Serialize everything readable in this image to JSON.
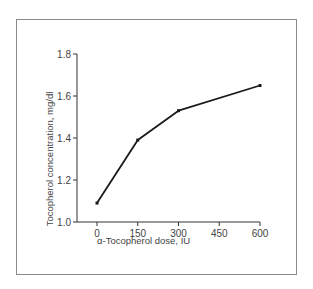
{
  "chart_data": {
    "type": "line",
    "title": "",
    "xlabel": "α-Tocopherol dose, IU",
    "ylabel": "Tocopherol concentration, mg/dl",
    "x": [
      0,
      150,
      300,
      600
    ],
    "series": [
      {
        "name": "Tocopherol concentration",
        "values": [
          1.09,
          1.39,
          1.53,
          1.65
        ]
      }
    ],
    "x_ticks": [
      "0",
      "150",
      "300",
      "450",
      "600"
    ],
    "y_ticks": [
      "1.0",
      "1.2",
      "1.4",
      "1.6",
      "1.8"
    ],
    "xlim": [
      0,
      600
    ],
    "ylim": [
      1.0,
      1.8
    ],
    "grid": false,
    "legend": "none",
    "colors": {
      "line": "#1a1a1a",
      "axis": "#333333",
      "frame": "#8a8a8a"
    }
  }
}
